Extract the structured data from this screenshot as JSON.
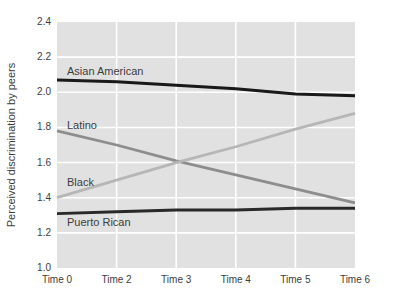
{
  "chart_data": {
    "type": "line",
    "title": "",
    "xlabel": "",
    "ylabel": "Perceived discrimination by peers",
    "x_tick_labels": [
      "Time 0",
      "Time 2",
      "Time 3",
      "Time 4",
      "Time 5",
      "Time 6"
    ],
    "y_ticks": [
      1.0,
      1.2,
      1.4,
      1.6,
      1.8,
      2.0,
      2.2,
      2.4
    ],
    "ylim": [
      1.0,
      2.4
    ],
    "grid": true,
    "legend_position": "inline-labels-on-lines",
    "colors": {
      "plot_background": "#e1e1e1",
      "gridline": "#ffffff",
      "text": "#3d3d3d"
    },
    "series": [
      {
        "name": "Asian American",
        "color": "#191919",
        "line_width": 3,
        "values": [
          2.07,
          2.06,
          2.04,
          2.02,
          1.99,
          1.98
        ],
        "label": {
          "x": 67,
          "y": 75
        }
      },
      {
        "name": "Latino",
        "color": "#8d8d8d",
        "line_width": 2.8,
        "values": [
          1.78,
          1.7,
          1.61,
          1.53,
          1.45,
          1.37
        ],
        "label": {
          "x": 67,
          "y": 129
        }
      },
      {
        "name": "Black",
        "color": "#b6b6b6",
        "line_width": 2.8,
        "values": [
          1.4,
          1.5,
          1.6,
          1.69,
          1.79,
          1.88
        ],
        "label": {
          "x": 67,
          "y": 186
        }
      },
      {
        "name": "Puerto Rican",
        "color": "#292929",
        "line_width": 2.8,
        "values": [
          1.31,
          1.32,
          1.33,
          1.33,
          1.34,
          1.34
        ],
        "label": {
          "x": 67,
          "y": 226
        }
      }
    ]
  }
}
